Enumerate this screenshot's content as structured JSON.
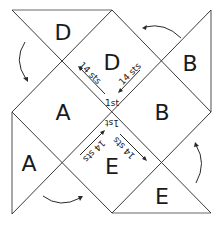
{
  "diagram": {
    "panels": {
      "top_outer": "D",
      "top_inner": "D",
      "right_outer": "B",
      "right_inner": "B",
      "left_outer": "A",
      "left_inner": "A",
      "bottom_outer": "E",
      "bottom_inner": "E"
    },
    "annotations": {
      "top_left_stitches": "14 sts",
      "top_right_stitches": "14 sts",
      "top_first": "1st",
      "bottom_left_stitches": "14 sts",
      "bottom_right_stitches": "14 sts",
      "bottom_first": "1st"
    },
    "arrows": [
      {
        "position": "top-left",
        "direction": "counterclockwise-down"
      },
      {
        "position": "top-right",
        "direction": "counterclockwise-left"
      },
      {
        "position": "bottom-left",
        "direction": "counterclockwise-right"
      },
      {
        "position": "bottom-right",
        "direction": "counterclockwise-up"
      }
    ]
  }
}
